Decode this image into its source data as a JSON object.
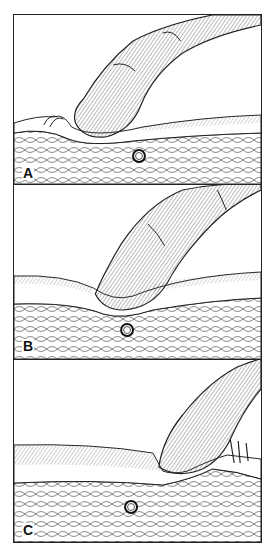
{
  "figure": {
    "panels": [
      {
        "id": "A",
        "label": "A",
        "description": "Finger pressing obliquely on skin beside vessel; skin wrinkles ahead of fingertip"
      },
      {
        "id": "B",
        "label": "B",
        "description": "Finger pressing straight down onto skin directly above vessel, compressing tissue"
      },
      {
        "id": "C",
        "label": "C",
        "description": "Finger pressing beyond vessel; skin wrinkles behind fingertip"
      }
    ],
    "colors": {
      "line": "#222222",
      "background": "#ffffff",
      "shade": "#7a7a7a"
    }
  }
}
